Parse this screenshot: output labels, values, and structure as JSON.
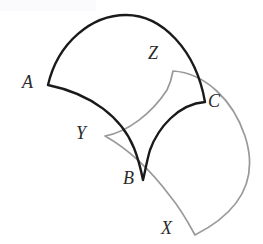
{
  "figure": {
    "width": 263,
    "height": 244,
    "background_color": "#ffffff",
    "labels": [
      {
        "id": "A",
        "text": "A",
        "x": 22,
        "y": 73,
        "color": "#2b2b2b"
      },
      {
        "id": "Z",
        "text": "Z",
        "x": 148,
        "y": 44,
        "color": "#2b2b2b"
      },
      {
        "id": "C",
        "text": "C",
        "x": 208,
        "y": 92,
        "color": "#2b2b2b"
      },
      {
        "id": "Y",
        "text": "Y",
        "x": 76,
        "y": 124,
        "color": "#2b2b2b"
      },
      {
        "id": "B",
        "text": "B",
        "x": 123,
        "y": 169,
        "color": "#2b2b2b"
      },
      {
        "id": "X",
        "text": "X",
        "x": 161,
        "y": 219,
        "color": "#2b2b2b"
      }
    ],
    "shapes": [
      {
        "id": "sector-abc",
        "name": "black-sector-ABC",
        "stroke_color": "#1a1a1a",
        "stroke_width": 2.4,
        "fill": "none",
        "vertices": [
          "A",
          "B",
          "C"
        ],
        "path": "M 48 85 C 58 42 92 15 126 15 C 162 15 196 50 205 102 L 205 102 C 178 104 158 128 150 150 C 147 160 145 172 143 180 C 141 170 138 158 134 148 C 122 118 92 94 48 85 Z"
      },
      {
        "id": "sector-xyz",
        "name": "gray-sector-XYZ",
        "stroke_color": "#9a9a9a",
        "stroke_width": 1.7,
        "fill": "none",
        "vertices": [
          "X",
          "Y",
          "Z"
        ],
        "path": "M 105 136 C 128 132 152 113 167 90 C 170 84 172 77 173 71 L 173 71 C 205 73 233 100 245 136 C 256 170 250 207 195 235 L 195 235 C 188 222 180 208 170 196 C 152 172 130 150 105 136 Z"
      }
    ]
  }
}
